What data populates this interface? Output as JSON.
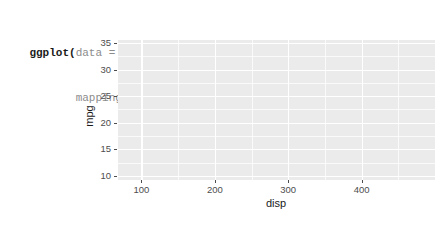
{
  "code": {
    "lines": [
      {
        "tokens": [
          {
            "text": "ggplot(",
            "kind": "fn"
          },
          {
            "text": "data",
            "kind": "arg"
          },
          {
            "text": " = ",
            "kind": "op"
          },
          {
            "text": "mtcars,",
            "kind": "val"
          }
        ]
      },
      {
        "tokens": [
          {
            "text": "       ",
            "kind": "indent"
          },
          {
            "text": "mapping",
            "kind": "arg"
          },
          {
            "text": " = ",
            "kind": "op"
          },
          {
            "text": "aes(",
            "kind": "fn"
          },
          {
            "text": "x",
            "kind": "arg"
          },
          {
            "text": " = ",
            "kind": "op"
          },
          {
            "text": "disp,",
            "kind": "val"
          },
          {
            "text": " ",
            "kind": "op"
          },
          {
            "text": "y",
            "kind": "arg"
          },
          {
            "text": " = ",
            "kind": "op"
          },
          {
            "text": "mpg))",
            "kind": "val"
          }
        ]
      }
    ],
    "line1_plain": "ggplot(data = mtcars,",
    "line2_plain": "       mapping = aes(x = disp, y = mpg))"
  },
  "chart_data": {
    "type": "scatter",
    "title": "",
    "subtitle": "",
    "xlabel": "disp",
    "ylabel": "mpg",
    "xlim": [
      68,
      500
    ],
    "ylim": [
      9.2,
      35.6
    ],
    "x_ticks": [
      100,
      200,
      300,
      400
    ],
    "y_ticks": [
      10,
      15,
      20,
      25,
      30,
      35
    ],
    "x_tick_labels": [
      "100",
      "200",
      "300",
      "400"
    ],
    "y_tick_labels": [
      "10",
      "15",
      "20",
      "25",
      "30",
      "35"
    ],
    "grid": true,
    "grid_major_color": "#ffffff",
    "grid_minor_color": "#ffffff",
    "panel_background": "#ebebeb",
    "plot_background": "#ffffff",
    "legend": "none",
    "series": [
      {
        "name": "mtcars",
        "x": [],
        "y": [],
        "note": "no geom layer — empty panel"
      }
    ],
    "annotations": []
  },
  "colors": {
    "panel": "#ebebeb",
    "gridline": "#ffffff",
    "axis_text": "#4d4d4d",
    "axis_title": "#1a1a1a",
    "code_function": "#1a1a1a",
    "code_argument": "#8c8c8c",
    "code_value": "#2b2b2b",
    "page_background": "#ffffff"
  }
}
